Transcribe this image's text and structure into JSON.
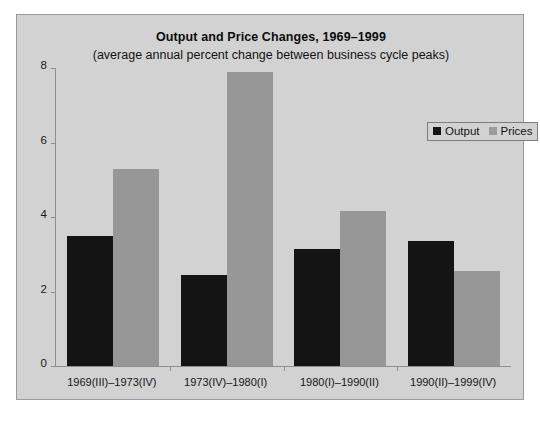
{
  "chart_data": {
    "type": "bar",
    "title": "Output and Price Changes, 1969–1999",
    "subtitle": "(average annual percent change between business cycle peaks)",
    "xlabel": "",
    "ylabel": "",
    "ylim": [
      0,
      8
    ],
    "yticks": [
      "0",
      "2",
      "4",
      "6",
      "8"
    ],
    "ytick_values": [
      0,
      2,
      4,
      6,
      8
    ],
    "grid": false,
    "legend_position": "upper right",
    "categories": [
      "1969(III)–1973(IV)",
      "1973(IV)–1980(I)",
      "1980(I)–1990(II)",
      "1990(II)–1999(IV)"
    ],
    "series": [
      {
        "name": "Output",
        "color": "#141414",
        "values": [
          3.5,
          2.45,
          3.15,
          3.35
        ]
      },
      {
        "name": "Prices",
        "color": "#979797",
        "values": [
          5.3,
          7.9,
          4.15,
          2.55
        ]
      }
    ]
  },
  "legend": {
    "items": [
      {
        "label": "Output"
      },
      {
        "label": "Prices"
      }
    ]
  },
  "colors": {
    "panel_background": "#d2d2d2",
    "output_bar": "#141414",
    "prices_bar": "#979797",
    "axis": "#8f8f8f"
  }
}
